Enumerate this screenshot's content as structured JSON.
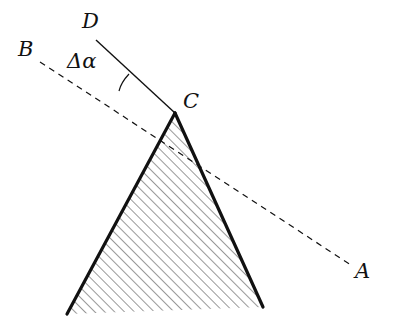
{
  "diagram": {
    "type": "geometry",
    "points": {
      "A": {
        "label": "A",
        "x": 351,
        "y": 265,
        "label_x": 355,
        "label_y": 261
      },
      "B": {
        "label": "B",
        "x": 40,
        "y": 62,
        "label_x": 18,
        "label_y": 39
      },
      "C": {
        "label": "C",
        "x": 175,
        "y": 113,
        "label_x": 183,
        "label_y": 91
      },
      "D": {
        "label": "D",
        "x": 96,
        "y": 40,
        "label_x": 82,
        "label_y": 11
      }
    },
    "angle": {
      "label": "Δα",
      "label_x": 67,
      "label_y": 51,
      "between": [
        "CD",
        "CB"
      ],
      "arc_start": {
        "x": 129,
        "y": 74
      },
      "arc_end": {
        "x": 119,
        "y": 91
      }
    },
    "lines": [
      {
        "id": "DC",
        "from": "D",
        "to": "C",
        "style": "solid"
      },
      {
        "id": "BA",
        "from": "B",
        "to": "A",
        "style": "dashed",
        "through": "C"
      }
    ],
    "body": {
      "shape": "triangle",
      "apex": {
        "x": 175,
        "y": 113
      },
      "base_left": {
        "x": 67,
        "y": 314
      },
      "base_right": {
        "x": 263,
        "y": 307
      },
      "fill": "hatched",
      "edges_bold": true
    },
    "colors": {
      "stroke": "#111111",
      "hatch": "#333333",
      "background": "#ffffff"
    }
  }
}
